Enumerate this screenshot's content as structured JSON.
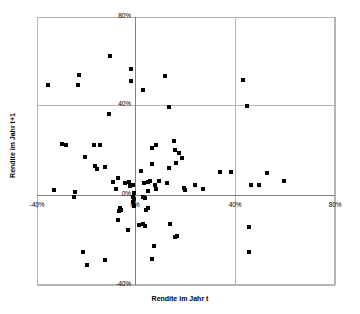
{
  "chart_data": {
    "type": "scatter",
    "title": "",
    "xlabel": "Rendite im Jahr t",
    "ylabel": "Rendite im Jahr t+1",
    "xlim": [
      -40,
      80
    ],
    "ylim": [
      -40,
      80
    ],
    "xticks": [
      "-40%",
      "0%",
      "40%",
      "80%"
    ],
    "xtick_values": [
      -40,
      0,
      40,
      80
    ],
    "yticks": [
      "-40%",
      "0%",
      "40%",
      "80%"
    ],
    "ytick_values": [
      -40,
      0,
      40,
      80
    ],
    "grid": true,
    "legend": null,
    "marker": "square",
    "marker_color": "#000000",
    "points": [
      [
        -35.5,
        49.5
      ],
      [
        -23.0,
        54.0
      ],
      [
        -23.5,
        49.5
      ],
      [
        -10.5,
        62.5
      ],
      [
        -2.0,
        56.5
      ],
      [
        -2.0,
        51.5
      ],
      [
        2.5,
        47.5
      ],
      [
        11.5,
        53.5
      ],
      [
        13.0,
        39.5
      ],
      [
        -11.0,
        36.5
      ],
      [
        -30.0,
        23.0
      ],
      [
        -28.5,
        22.5
      ],
      [
        -20.5,
        17.5
      ],
      [
        -17.0,
        22.5
      ],
      [
        -14.5,
        22.5
      ],
      [
        -16.5,
        13.5
      ],
      [
        -16.0,
        12.0
      ],
      [
        -12.5,
        13.0
      ],
      [
        -7.5,
        8.0
      ],
      [
        -8.0,
        3.0
      ],
      [
        -33.0,
        2.5
      ],
      [
        -24.5,
        1.5
      ],
      [
        -25.0,
        -0.5
      ],
      [
        -9.5,
        6.0
      ],
      [
        -4.5,
        5.5
      ],
      [
        -3.0,
        6.0
      ],
      [
        -2.5,
        4.5
      ],
      [
        -1.5,
        5.0
      ],
      [
        -1.0,
        1.0
      ],
      [
        -1.5,
        -0.5
      ],
      [
        -1.0,
        -1.5
      ],
      [
        -1.5,
        -3.0
      ],
      [
        -1.0,
        -4.5
      ],
      [
        -6.5,
        -5.5
      ],
      [
        -6.0,
        -6.5
      ],
      [
        -7.0,
        -7.0
      ],
      [
        -7.5,
        -11.0
      ],
      [
        -3.5,
        -15.5
      ],
      [
        -21.5,
        -25.0
      ],
      [
        -20.0,
        -31.0
      ],
      [
        -12.5,
        -29.0
      ],
      [
        1.0,
        -13.0
      ],
      [
        2.5,
        -12.5
      ],
      [
        3.5,
        -13.5
      ],
      [
        2.5,
        -0.5
      ],
      [
        3.5,
        -1.0
      ],
      [
        4.5,
        -5.5
      ],
      [
        4.0,
        -6.5
      ],
      [
        4.5,
        2.0
      ],
      [
        2.0,
        11.0
      ],
      [
        3.0,
        5.5
      ],
      [
        4.5,
        6.0
      ],
      [
        5.5,
        6.5
      ],
      [
        6.5,
        21.5
      ],
      [
        8.0,
        22.5
      ],
      [
        6.5,
        14.0
      ],
      [
        7.5,
        5.0
      ],
      [
        9.0,
        6.5
      ],
      [
        8.0,
        3.0
      ],
      [
        7.0,
        -22.5
      ],
      [
        6.5,
        -28.5
      ],
      [
        12.5,
        5.5
      ],
      [
        13.0,
        12.5
      ],
      [
        15.0,
        24.5
      ],
      [
        15.5,
        20.5
      ],
      [
        16.0,
        14.5
      ],
      [
        17.0,
        19.0
      ],
      [
        13.5,
        -12.5
      ],
      [
        15.5,
        -18.5
      ],
      [
        16.5,
        -18.0
      ],
      [
        18.5,
        17.0
      ],
      [
        19.0,
        3.5
      ],
      [
        19.5,
        2.5
      ],
      [
        23.5,
        5.0
      ],
      [
        27.0,
        3.0
      ],
      [
        33.5,
        10.5
      ],
      [
        38.0,
        10.5
      ],
      [
        44.5,
        40.0
      ],
      [
        43.0,
        52.0
      ],
      [
        46.0,
        5.0
      ],
      [
        45.5,
        -14.0
      ],
      [
        45.5,
        -25.0
      ],
      [
        49.5,
        5.0
      ],
      [
        52.5,
        10.0
      ],
      [
        59.5,
        6.5
      ]
    ]
  }
}
